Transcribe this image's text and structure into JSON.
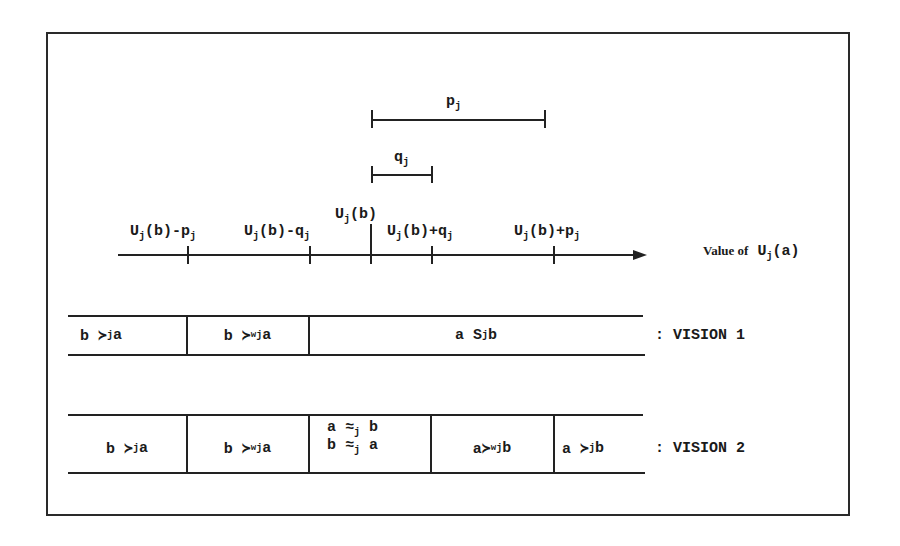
{
  "diagram": {
    "thresholds": {
      "p": {
        "symbol": "p",
        "sub": "j"
      },
      "q": {
        "symbol": "q",
        "sub": "j"
      }
    },
    "axis": {
      "title_prefix": "Value of",
      "title_func": "U",
      "title_sub": "j",
      "title_arg": "(a)",
      "ticks": [
        {
          "pre": "U",
          "sub": "j",
          "mid": "(b)-p",
          "sub2": "j"
        },
        {
          "pre": "U",
          "sub": "j",
          "mid": "(b)-q",
          "sub2": "j"
        },
        {
          "pre": "U",
          "sub": "j",
          "mid": "(b)",
          "sub2": ""
        },
        {
          "pre": "U",
          "sub": "j",
          "mid": "(b)+q",
          "sub2": "j"
        },
        {
          "pre": "U",
          "sub": "j",
          "mid": "(b)+p",
          "sub2": "j"
        }
      ]
    },
    "vision1": {
      "label": ": VISION 1",
      "cells": [
        {
          "left": "b ≻",
          "sub": "j",
          "sup": "",
          "right": " a"
        },
        {
          "left": "b ≻",
          "sub": "j",
          "sup": "w",
          "right": " a"
        },
        {
          "left": "a S",
          "sub": "j",
          "sup": "",
          "right": " b"
        }
      ]
    },
    "vision2": {
      "label": ": VISION 2",
      "cells": [
        {
          "left": "b ≻",
          "sub": "j",
          "sup": "",
          "right": " a"
        },
        {
          "left": "b ≻",
          "sub": "j",
          "sup": "w",
          "right": " a"
        },
        {
          "line1_left": "a ≈",
          "line1_sub": "j",
          "line1_right": " b",
          "line2_left": "b ≈",
          "line2_sub": "j",
          "line2_right": " a"
        },
        {
          "left": "a≻",
          "sub": "j",
          "sup": "w",
          "right": " b"
        },
        {
          "left": "a ≻",
          "sub": "j",
          "sup": "",
          "right": " b"
        }
      ]
    }
  }
}
